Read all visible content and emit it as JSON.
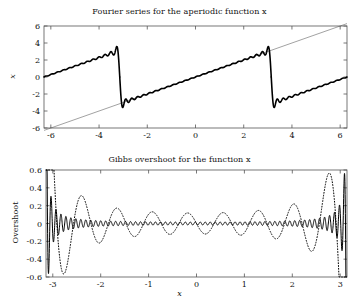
{
  "figure": {
    "background": "#ffffff",
    "foreground": "#111111",
    "width": 359,
    "height": 306
  },
  "panels": [
    {
      "id": "top",
      "title": "Fourier series for the aperiodic function x",
      "ylabel": "x",
      "xlabel": "",
      "xticks": [
        "-6",
        "-4",
        "-2",
        "0",
        "2",
        "4",
        "6"
      ],
      "yticks": [
        "-6",
        "-4",
        "-2",
        "0",
        "2",
        "4",
        "6"
      ]
    },
    {
      "id": "bottom",
      "title": "Gibbs overshoot for the function x",
      "ylabel": "Overshoot",
      "xlabel": "x",
      "xticks": [
        "-3",
        "-2",
        "-1",
        "0",
        "1",
        "2",
        "3"
      ],
      "yticks": [
        "-0.6",
        "-0.4",
        "-0.2",
        "0",
        "0.2",
        "0.4",
        "0.6"
      ]
    }
  ],
  "chart_data": [
    {
      "type": "line",
      "title": "Fourier series for the aperiodic function x",
      "xlabel": "",
      "ylabel": "x",
      "xlim": [
        -6.2832,
        6.2832
      ],
      "ylim": [
        -6,
        6
      ],
      "xticks": [
        -6,
        -4,
        -2,
        0,
        2,
        4,
        6
      ],
      "yticks": [
        -6,
        -4,
        -2,
        0,
        2,
        4,
        6
      ],
      "grid": false,
      "legend": "none",
      "series": [
        {
          "name": "identity line y = x",
          "style": "thin-solid",
          "color": "#444444",
          "linewidth": 0.5,
          "description": "Straight reference line from (-6.2832,-6.2832) to (6.2832,6.2832), the aperiodic function x",
          "x": [
            -6.2832,
            6.2832
          ],
          "values": [
            -6.2832,
            6.2832
          ]
        },
        {
          "name": "Fourier partial sum (sawtooth, period 2pi)",
          "style": "thick-solid",
          "color": "#000000",
          "linewidth": 1.6,
          "description": "Truncated Fourier sine series 2*sum_{n=1..N} (-1)^(n+1) sin(n x)/n with N about 25; wavy sawtooth with jump discontinuities at x = -pi and x = +pi, ringing overshoot to about +/-3.5 at the jumps",
          "harmonics": 25,
          "period": 6.2832,
          "jump_points": [
            -3.1416,
            3.1416
          ],
          "overshoot_peak": 3.5,
          "segment_endpoints": [
            {
              "x": -6.2832,
              "y": 0.0
            },
            {
              "x": -3.2,
              "y": 3.3
            },
            {
              "x": -3.1416,
              "y": -3.3
            },
            {
              "x": 0.0,
              "y": 0.0
            },
            {
              "x": 3.1416,
              "y": 3.3
            },
            {
              "x": 3.2,
              "y": -3.3
            },
            {
              "x": 6.2832,
              "y": 0.0
            }
          ]
        }
      ]
    },
    {
      "type": "line",
      "title": "Gibbs overshoot for the function x",
      "xlabel": "x",
      "ylabel": "Overshoot",
      "xlim": [
        -3.1416,
        3.1416
      ],
      "ylim": [
        -0.6,
        0.6
      ],
      "xticks": [
        -3,
        -2,
        -1,
        0,
        1,
        2,
        3
      ],
      "yticks": [
        -0.6,
        -0.4,
        -0.2,
        0,
        0.2,
        0.4,
        0.6
      ],
      "grid": false,
      "legend": "none",
      "series": [
        {
          "name": "error of low-order partial sum",
          "style": "dotted",
          "color": "#000000",
          "linewidth": 1.0,
          "description": "Error curve for a low number of harmonics: slow oscillation with large Gibbs lobes near the endpoints, peaking about +0.55 at x = -2.9 and about -0.55 at x = +2.9, dipping to about -0.4 near x = -2.55 and +0.4 near x = +2.55, nearly flat in the interior",
          "harmonics": 8,
          "peak_amplitude": 0.55,
          "interior_amplitude": 0.03
        },
        {
          "name": "error of high-order partial sum",
          "style": "solid",
          "color": "#000000",
          "linewidth": 1.0,
          "description": "Error curve for a high number of harmonics: rapid oscillation of amplitude about 0.12 across the interior, growing into very dense ringing of amplitude about 0.55 within a narrow band at both endpoints x = -3.14 and x = +3.14",
          "harmonics": 60,
          "peak_amplitude": 0.55,
          "interior_amplitude": 0.12
        }
      ]
    }
  ]
}
